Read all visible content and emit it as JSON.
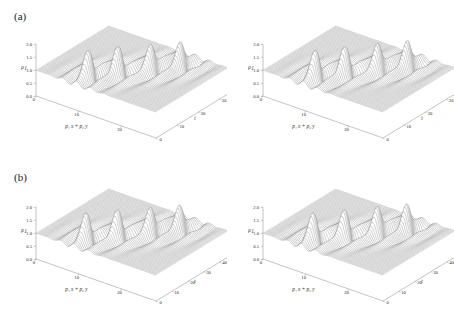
{
  "figure": {
    "background": "#ffffff",
    "line_color": "#555555",
    "text_color": "#222222",
    "rows": 2,
    "cols": 2
  },
  "panels": [
    {
      "id": "panel-a-left",
      "label": "(a)",
      "show_label": true,
      "zaxis": {
        "label": "ρ",
        "sub": "1",
        "ticks": [
          "0.0",
          "0.5",
          "1.0",
          "1.5",
          "2.0"
        ],
        "min": 0.0,
        "max": 2.0
      },
      "xaxis": {
        "label": "p₁ x + p₂ y",
        "ticks": [
          "0",
          "10",
          "20"
        ],
        "min": 0,
        "max": 28
      },
      "taxis": {
        "label": "t",
        "ticks": [
          "0",
          "10",
          "20",
          "30"
        ],
        "min": 0,
        "max": 34
      }
    },
    {
      "id": "panel-a-right",
      "label": "",
      "show_label": false,
      "zaxis": {
        "label": "ρ",
        "sub": "1",
        "ticks": [
          "0.0",
          "0.5",
          "1.0",
          "1.5",
          "2.0"
        ],
        "min": 0.0,
        "max": 2.0
      },
      "xaxis": {
        "label": "p₁ x + p₂ y",
        "ticks": [
          "0",
          "10",
          "20"
        ],
        "min": 0,
        "max": 28
      },
      "taxis": {
        "label": "t",
        "ticks": [
          "0",
          "10",
          "20",
          "30"
        ],
        "min": 0,
        "max": 34
      }
    },
    {
      "id": "panel-b-left",
      "label": "(b)",
      "show_label": true,
      "zaxis": {
        "label": "ρ",
        "sub": "1",
        "ticks": [
          "0.0",
          "0.5",
          "1.0",
          "1.5",
          "2.0"
        ],
        "min": 0.0,
        "max": 2.0
      },
      "xaxis": {
        "label": "p₁ x + p₂ y",
        "ticks": [
          "0",
          "10",
          "20"
        ],
        "min": 0,
        "max": 28
      },
      "taxis": {
        "label": "t",
        "ticks": [
          "0",
          "10",
          "20",
          "30",
          "40"
        ],
        "min": 0,
        "max": 45
      }
    },
    {
      "id": "panel-b-right",
      "label": "",
      "show_label": false,
      "zaxis": {
        "label": "ρ",
        "sub": "1",
        "ticks": [
          "0.0",
          "0.5",
          "1.0",
          "1.5",
          "2.0"
        ],
        "min": 0.0,
        "max": 2.0
      },
      "xaxis": {
        "label": "p₁ x + p₂ y",
        "ticks": [
          "0",
          "10",
          "20"
        ],
        "min": 0,
        "max": 28
      },
      "taxis": {
        "label": "t",
        "ticks": [
          "0",
          "10",
          "20",
          "30",
          "40"
        ],
        "min": 0,
        "max": 45
      }
    }
  ],
  "chart_data": {
    "type": "line",
    "title": "",
    "xlabel": "p₁ x + p₂ y",
    "ylabel": "t",
    "zlabel": "ρ₁",
    "plot_style": "3d wireframe mesh surface, grayscale, constant-t curves",
    "grid": false,
    "legend": null,
    "panels": [
      {
        "name": "(a) left",
        "xlim": [
          0,
          28
        ],
        "ylim": [
          0,
          34
        ],
        "zlim": [
          0.0,
          2.0
        ],
        "xticks": [
          0,
          10,
          20
        ],
        "yticks": [
          0,
          10,
          20,
          30
        ],
        "zticks": [
          0.0,
          0.5,
          1.0,
          1.5,
          2.0
        ],
        "baseline_z": 1.0,
        "peaks": [
          {
            "x": 9.5,
            "t": 6.0,
            "z": 2.0
          },
          {
            "x": 13.0,
            "t": 13.0,
            "z": 2.0
          },
          {
            "x": 17.0,
            "t": 20.5,
            "z": 1.95
          },
          {
            "x": 20.5,
            "t": 27.5,
            "z": 1.9
          }
        ],
        "troughs": [
          {
            "x": 10.5,
            "t": 8.0,
            "z": 0.1
          },
          {
            "x": 14.0,
            "t": 15.0,
            "z": 0.1
          },
          {
            "x": 18.0,
            "t": 22.0,
            "z": 0.1
          },
          {
            "x": 21.5,
            "t": 29.0,
            "z": 0.05
          }
        ],
        "description": "Periodic rogue-wave / breather train along a tilted line in the (p₁x+p₂y, t) plane; four sharp peaks reaching ρ₁≈2 with adjacent deep dips toward 0, flat background ρ₁=1"
      },
      {
        "name": "(a) right",
        "xlim": [
          0,
          28
        ],
        "ylim": [
          0,
          34
        ],
        "zlim": [
          0.0,
          2.0
        ],
        "xticks": [
          0,
          10,
          20
        ],
        "yticks": [
          0,
          10,
          20,
          30
        ],
        "zticks": [
          0.0,
          0.5,
          1.0,
          1.5,
          2.0
        ],
        "baseline_z": 1.0,
        "peaks": [
          {
            "x": 9.5,
            "t": 6.0,
            "z": 2.0
          },
          {
            "x": 13.0,
            "t": 13.0,
            "z": 2.0
          },
          {
            "x": 17.0,
            "t": 20.5,
            "z": 2.0
          },
          {
            "x": 20.5,
            "t": 27.5,
            "z": 1.95
          }
        ],
        "troughs": [
          {
            "x": 10.5,
            "t": 8.0,
            "z": 0.08
          },
          {
            "x": 14.0,
            "t": 15.0,
            "z": 0.08
          },
          {
            "x": 18.0,
            "t": 22.0,
            "z": 0.08
          },
          {
            "x": 21.5,
            "t": 29.0,
            "z": 0.05
          }
        ],
        "description": "Same periodic wave train as (a) left with slightly narrower peaks"
      },
      {
        "name": "(b) left",
        "xlim": [
          0,
          28
        ],
        "ylim": [
          0,
          45
        ],
        "zlim": [
          0.0,
          2.0
        ],
        "xticks": [
          0,
          10,
          20
        ],
        "yticks": [
          0,
          10,
          20,
          30,
          40
        ],
        "zticks": [
          0.0,
          0.5,
          1.0,
          1.5,
          2.0
        ],
        "baseline_z": 1.0,
        "peaks": [
          {
            "x": 9.0,
            "t": 8.0,
            "z": 2.0
          },
          {
            "x": 13.0,
            "t": 17.0,
            "z": 2.0
          },
          {
            "x": 17.0,
            "t": 27.0,
            "z": 1.95
          },
          {
            "x": 20.5,
            "t": 36.0,
            "z": 1.9
          }
        ],
        "troughs": [
          {
            "x": 10.0,
            "t": 10.5,
            "z": 0.1
          },
          {
            "x": 14.0,
            "t": 19.5,
            "z": 0.1
          },
          {
            "x": 18.0,
            "t": 29.0,
            "z": 0.08
          },
          {
            "x": 21.5,
            "t": 38.0,
            "z": 0.05
          }
        ],
        "description": "Periodic rogue-wave train over longer time window t∈[0,45], four peaks of amplitude ≈2"
      },
      {
        "name": "(b) right",
        "xlim": [
          0,
          28
        ],
        "ylim": [
          0,
          45
        ],
        "zlim": [
          0.0,
          2.0
        ],
        "xticks": [
          0,
          10,
          20
        ],
        "yticks": [
          0,
          10,
          20,
          30,
          40
        ],
        "zticks": [
          0.0,
          0.5,
          1.0,
          1.5,
          2.0
        ],
        "baseline_z": 1.0,
        "peaks": [
          {
            "x": 9.0,
            "t": 8.0,
            "z": 2.0
          },
          {
            "x": 13.0,
            "t": 17.0,
            "z": 2.0
          },
          {
            "x": 17.0,
            "t": 27.0,
            "z": 2.0
          },
          {
            "x": 20.5,
            "t": 36.0,
            "z": 1.95
          }
        ],
        "troughs": [
          {
            "x": 10.0,
            "t": 10.5,
            "z": 0.08
          },
          {
            "x": 14.0,
            "t": 19.5,
            "z": 0.08
          },
          {
            "x": 18.0,
            "t": 29.0,
            "z": 0.06
          },
          {
            "x": 21.5,
            "t": 38.0,
            "z": 0.05
          }
        ],
        "description": "Same as (b) left with slightly sharper peak structure"
      }
    ]
  }
}
